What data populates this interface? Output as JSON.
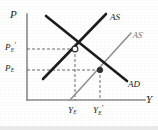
{
  "figure": {
    "type": "economics-diagram",
    "name": "aggregate-demand-aggregate-supply-shift"
  },
  "axes": {
    "y_label": "P",
    "x_label": "Y",
    "origin": {
      "x": 27,
      "y": 100
    },
    "x_end": 145,
    "y_end": 14,
    "color": "#8a8a8a"
  },
  "y_ticks": [
    {
      "id": "pe-prime",
      "base": "P",
      "sub": "E",
      "prime": "′",
      "y": 49
    },
    {
      "id": "pe",
      "base": "P",
      "sub": "E",
      "prime": "",
      "y": 70
    }
  ],
  "x_ticks": [
    {
      "id": "ye",
      "base": "Y",
      "sub": "E",
      "prime": "",
      "x": 75
    },
    {
      "id": "ye-prime",
      "base": "Y",
      "sub": "E",
      "prime": "′",
      "x": 100
    }
  ],
  "curves": [
    {
      "id": "as",
      "label": "AS",
      "prime": "",
      "color": "#1c1c1c",
      "width": 2.6,
      "x1": 43,
      "y1": 79,
      "x2": 106,
      "y2": 14,
      "label_x": 110,
      "label_y": 13
    },
    {
      "id": "as-prime",
      "label": "AS",
      "prime": "′",
      "color": "#8d8d8d",
      "width": 1.5,
      "x1": 70,
      "y1": 100,
      "x2": 131,
      "y2": 33,
      "label_x": 133,
      "label_y": 31
    },
    {
      "id": "ad",
      "label": "AD",
      "prime": "",
      "color": "#1c1c1c",
      "width": 2.6,
      "x1": 46,
      "y1": 16,
      "x2": 127,
      "y2": 81,
      "label_x": 128,
      "label_y": 80
    }
  ],
  "equilibria": [
    {
      "id": "initial-equilibrium",
      "marker": "open-circle",
      "x": 75,
      "y": 49,
      "fill": "#ffffff",
      "stroke": "#2a2a2a"
    },
    {
      "id": "new-equilibrium",
      "marker": "filled-dot",
      "x": 100,
      "y": 70,
      "fill": "#2e2e2e",
      "stroke": "#2e2e2e"
    }
  ],
  "guides": [
    {
      "id": "guide-pe-prime-horizontal",
      "x1": 27,
      "y1": 49,
      "x2": 75,
      "y2": 49
    },
    {
      "id": "guide-pe-horizontal",
      "x1": 27,
      "y1": 70,
      "x2": 100,
      "y2": 70
    },
    {
      "id": "guide-ye-vertical",
      "x1": 75,
      "y1": 49,
      "x2": 75,
      "y2": 100
    },
    {
      "id": "guide-ye-prime-vertical",
      "x1": 100,
      "y1": 70,
      "x2": 100,
      "y2": 100
    }
  ],
  "style": {
    "guide_color": "#5a5a5a",
    "guide_dash": "3 2",
    "background": "#ffffff"
  }
}
